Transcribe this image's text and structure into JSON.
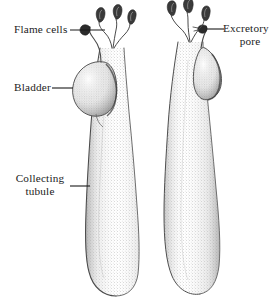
{
  "figure": {
    "background_color": "#ffffff",
    "ink_color": "#1b1b1b",
    "width": 279,
    "height": 301
  },
  "labels": [
    {
      "id": "flame-cells",
      "text": "Flame cells",
      "lines": [
        "Flame cells"
      ],
      "leader": {
        "from_x": 70,
        "from_y": 30,
        "to_x": 105,
        "to_y": 30
      }
    },
    {
      "id": "bladder",
      "text": "Bladder",
      "lines": [
        "Bladder"
      ],
      "leader": {
        "from_x": 52,
        "from_y": 88,
        "to_x": 73,
        "to_y": 88
      }
    },
    {
      "id": "collecting-tubule",
      "text": "Collecting tubule",
      "lines": [
        "Collecting",
        "tubule"
      ],
      "leader": {
        "from_x": 70,
        "from_y": 186,
        "to_x": 90,
        "to_y": 186
      }
    },
    {
      "id": "excretory-pore",
      "text": "Excretory pore",
      "lines": [
        "Excretory",
        "pore"
      ],
      "leader": {
        "from_x": 207,
        "from_y": 29,
        "to_x": 223,
        "to_y": 29
      }
    }
  ],
  "structures": {
    "left_unit": {
      "name": "left protonephridium",
      "flame_cell_count": 3,
      "has_bladder": true,
      "bladder_side": "left",
      "shading": "stippled"
    },
    "right_unit": {
      "name": "right protonephridium",
      "flame_cell_count": 3,
      "has_bladder": true,
      "bladder_side": "right",
      "shading": "stippled"
    }
  },
  "icons": {
    "leader_line": "leader-line-icon",
    "flame_cell": "flame-cell-icon",
    "bladder": "bladder-icon",
    "tubule": "collecting-tubule-icon"
  }
}
